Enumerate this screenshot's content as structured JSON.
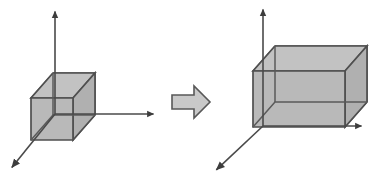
{
  "figure": {
    "background_color": "#ffffff",
    "solid_fill_color": "#b9b9b9",
    "solid_fill_top_color": "#c2c2c2",
    "solid_fill_side_color": "#b0b0b0",
    "edge_color": "#4f4f4f",
    "axis_color": "#4a4a4a",
    "arrow_fill_color": "#c9c9c9",
    "arrow_edge_color": "#585858"
  },
  "panels": [
    {
      "id": "before",
      "name": "original-cube-panel",
      "shape_label": "cube",
      "axes": [
        {
          "name": "y-axis",
          "direction": "up",
          "origin": [
            55,
            114
          ],
          "tip": [
            55,
            7
          ]
        },
        {
          "name": "x-axis",
          "direction": "right",
          "origin": [
            55,
            114
          ],
          "tip": [
            158,
            114
          ]
        },
        {
          "name": "z-axis",
          "direction": "down-left",
          "origin": [
            55,
            114
          ],
          "tip": [
            9,
            171
          ]
        }
      ],
      "box": {
        "name": "cube",
        "front_face": {
          "x": 31,
          "y": 98,
          "width": 42,
          "height": 42
        },
        "depth_offset": [
          22,
          -25
        ],
        "width_units": 1,
        "height_units": 1,
        "depth_units": 1
      }
    },
    {
      "id": "after",
      "name": "scaled-box-panel",
      "shape_label": "scaled box",
      "axes": [
        {
          "name": "y-axis",
          "direction": "up",
          "origin": [
            263,
            126
          ],
          "tip": [
            263,
            5
          ]
        },
        {
          "name": "x-axis",
          "direction": "right",
          "origin": [
            263,
            126
          ],
          "tip": [
            366,
            126
          ]
        },
        {
          "name": "z-axis",
          "direction": "down-left",
          "origin": [
            263,
            126
          ],
          "tip": [
            213,
            173
          ]
        }
      ],
      "box": {
        "name": "scaled-box",
        "front_face": {
          "x": 253,
          "y": 71,
          "width": 92,
          "height": 56
        },
        "depth_offset": [
          22,
          -25
        ],
        "width_units": 2,
        "height_units": 1,
        "depth_units": 1
      }
    }
  ],
  "transform_arrow": {
    "name": "transform-arrow",
    "label": "",
    "direction": "right",
    "bounds": {
      "x": 172,
      "y": 86,
      "width": 38,
      "height": 32
    }
  }
}
